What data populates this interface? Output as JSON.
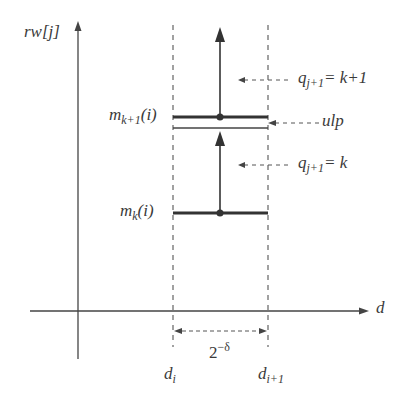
{
  "diagram": {
    "axes": {
      "y_label": "rw[j]",
      "x_label": "d"
    },
    "levels": {
      "upper": {
        "name": "m",
        "sub": "k+1",
        "arg": "(i)"
      },
      "lower": {
        "name": "m",
        "sub": "k",
        "arg": "(i)"
      }
    },
    "annotations": {
      "q_upper": {
        "name": "q",
        "sub": "j+1",
        "rhs": "= k+1"
      },
      "ulp": "ulp",
      "q_lower": {
        "name": "q",
        "sub": "j+1",
        "rhs": "= k"
      }
    },
    "interval": {
      "width_base": "2",
      "width_exp": "−δ",
      "left": {
        "name": "d",
        "sub": "i"
      },
      "right": {
        "name": "d",
        "sub": "i+1"
      }
    },
    "colors": {
      "line": "#333333",
      "dashed": "#555555"
    }
  }
}
